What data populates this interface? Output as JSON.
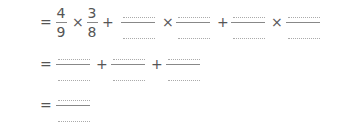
{
  "worksheet": {
    "line1": {
      "equals": "=",
      "frac1": {
        "numerator": "4",
        "denominator": "9"
      },
      "times1": "×",
      "frac2": {
        "numerator": "3",
        "denominator": "8"
      },
      "plus1": "+",
      "times2": "×",
      "plus2": "+",
      "times3": "×",
      "blank_fraction_count": 4
    },
    "line2": {
      "equals": "=",
      "plus1": "+",
      "plus2": "+",
      "blank_fraction_count": 3
    },
    "line3": {
      "equals": "=",
      "blank_fraction_count": 1
    }
  }
}
